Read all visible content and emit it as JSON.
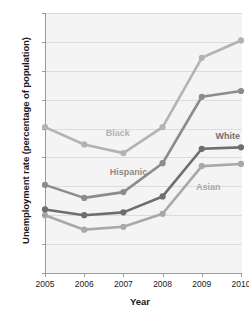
{
  "chart_data": {
    "type": "line",
    "title": "",
    "xlabel": "Year",
    "ylabel": "Unemployment rate (percentage of population)",
    "x": [
      2005,
      2006,
      2007,
      2008,
      2009,
      2010
    ],
    "categories": [
      "2005",
      "2006",
      "2007",
      "2008",
      "2009",
      "2010"
    ],
    "xtick_labels": [
      "2005",
      "2006",
      "2007",
      "2008",
      "2009",
      "2010"
    ],
    "ytick_labels": [
      "0%",
      "2%",
      "4%",
      "6%",
      "8%",
      "10%",
      "12%",
      "14%",
      "16%",
      "18%"
    ],
    "ytick_values": [
      0,
      2,
      4,
      6,
      8,
      10,
      12,
      14,
      16,
      18
    ],
    "ylim": [
      0,
      18
    ],
    "xlim": [
      2005,
      2010
    ],
    "grid": "horizontal",
    "legend_position": "inline-annotations",
    "series": [
      {
        "name": "Black",
        "color": "#b3b3b3",
        "values": [
          10.1,
          8.9,
          8.3,
          10.1,
          14.9,
          16.1
        ],
        "label_x": 2006.55,
        "label_y": 9.6
      },
      {
        "name": "Hispanic",
        "color": "#8c8c8c",
        "values": [
          6.1,
          5.2,
          5.6,
          7.6,
          12.2,
          12.6
        ],
        "label_x": 2006.65,
        "label_y": 6.95
      },
      {
        "name": "White",
        "color": "#6e6e6e",
        "values": [
          4.4,
          4.0,
          4.2,
          5.3,
          8.6,
          8.7
        ],
        "label_x": 2009.35,
        "label_y": 9.45
      },
      {
        "name": "Asian",
        "color": "#a8a8a8",
        "values": [
          4.0,
          3.0,
          3.2,
          4.1,
          7.4,
          7.55
        ],
        "label_x": 2008.85,
        "label_y": 5.9
      }
    ]
  }
}
